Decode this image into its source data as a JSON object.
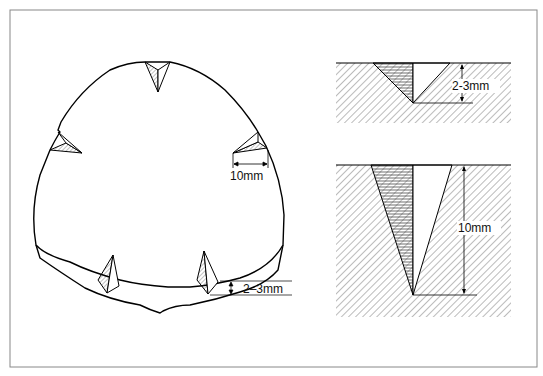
{
  "figure": {
    "left_panel": {
      "title": "Stone with V-notches cut around circumference",
      "width_label": "10mm",
      "depth_label": "2–3mm"
    },
    "right_top": {
      "title": "Shallow notch cross-section",
      "depth_label": "2-3mm"
    },
    "right_bottom": {
      "title": "Deep notch cross-section",
      "depth_label": "10mm"
    }
  }
}
